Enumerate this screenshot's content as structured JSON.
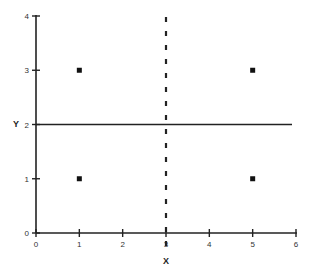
{
  "chart_data": {
    "type": "scatter",
    "title": "",
    "xlabel": "X",
    "ylabel": "Y",
    "xlim": [
      0,
      6
    ],
    "ylim": [
      0,
      4
    ],
    "x_ticks": [
      "0",
      "1",
      "2",
      "3",
      "4",
      "5",
      "6"
    ],
    "y_ticks": [
      "0",
      "1",
      "2",
      "3",
      "4"
    ],
    "grid": false,
    "legend": null,
    "series": [
      {
        "name": "points",
        "x": [
          1,
          5,
          1,
          5
        ],
        "y": [
          3,
          3,
          1,
          1
        ],
        "marker": "square"
      }
    ],
    "reference_lines": [
      {
        "orientation": "horizontal",
        "value": 2,
        "style": "solid"
      },
      {
        "orientation": "vertical",
        "value": 3,
        "style": "dashed"
      }
    ]
  }
}
